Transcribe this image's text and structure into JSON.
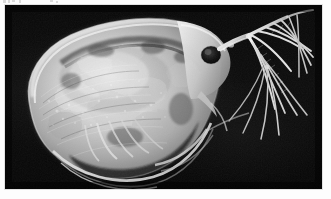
{
  "page": {
    "background_color": "#fdfdfd",
    "width": 331,
    "height": 199
  },
  "photo": {
    "name": "daphnia-micrograph",
    "subject": "Daphnia (water flea), lateral view",
    "technique": "light micrograph, monochrome",
    "background_color": "#0a0a0a",
    "specimen_color": "#d8d8d8",
    "frame": {
      "x": 5,
      "y": 5,
      "width": 317,
      "height": 184
    },
    "alt_text": "Black and white microscope photograph of a Daphnia water flea seen from the side, body facing left, branched swimming antennae extending to the upper right.",
    "parts": [
      {
        "name": "carapace",
        "label": "carapace"
      },
      {
        "name": "compound-eye",
        "label": "compound eye"
      },
      {
        "name": "rostrum",
        "label": "rostrum"
      },
      {
        "name": "antennule",
        "label": "antennule"
      },
      {
        "name": "second-antenna",
        "label": "second antenna"
      },
      {
        "name": "antennal-setae",
        "label": "antennal setae"
      },
      {
        "name": "brood-chamber",
        "label": "brood chamber"
      },
      {
        "name": "thoracic-limbs",
        "label": "thoracic limbs"
      },
      {
        "name": "ventral-carapace-margin",
        "label": "ventral carapace margin"
      },
      {
        "name": "postabdomen",
        "label": "postabdomen"
      },
      {
        "name": "apical-spine",
        "label": "apical spine"
      }
    ]
  },
  "artifacts": {
    "top_margin_specks": 6,
    "color": "#bdbdbd"
  }
}
